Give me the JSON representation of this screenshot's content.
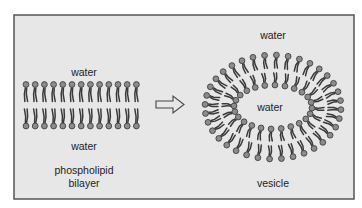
{
  "figure": {
    "frame": {
      "x": 14,
      "y": 15,
      "width": 340,
      "height": 184,
      "fill": "#e7e7e7",
      "stroke": "#555555"
    },
    "colors": {
      "head_fill": "#8c8c8c",
      "head_stroke": "#333333",
      "tail": "#3a3a3a",
      "text": "#222222",
      "arrow_fill": "#e7e7e7",
      "arrow_stroke": "#444444"
    }
  },
  "bilayer": {
    "label_top": "water",
    "label_bottom": "water",
    "caption_line1": "phospholipid",
    "caption_line2": "bilayer",
    "count_per_row": 13,
    "start_x": 26,
    "spacing": 9.2
  },
  "arrow": {
    "label": "transforms-into"
  },
  "vesicle": {
    "label_outside": "water",
    "label_inside": "water",
    "caption": "vesicle",
    "center_x": 273,
    "center_y": 107,
    "outer_layer": {
      "rx": 68,
      "ry": 52,
      "count": 36
    },
    "inner_layer": {
      "rx": 39,
      "ry": 22,
      "count": 24
    }
  }
}
